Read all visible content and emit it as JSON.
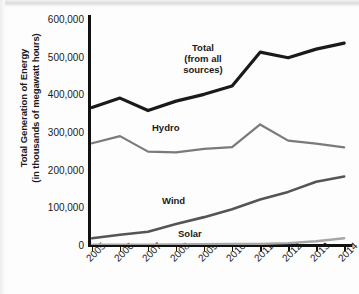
{
  "chart_data": {
    "type": "line",
    "title": "",
    "xlabel": "",
    "ylabel": "Total Generation of Energy (in thousands of megawatt hours)",
    "ylabel_line1": "Total Generation of Energy",
    "ylabel_line2": "(in thousands of megawatt hours)",
    "categories": [
      "2005",
      "2006",
      "2007",
      "2008",
      "2009",
      "2010",
      "2011",
      "2012",
      "2013",
      "2014"
    ],
    "x": [
      2005,
      2006,
      2007,
      2008,
      2009,
      2010,
      2011,
      2012,
      2013,
      2014
    ],
    "ylim": [
      0,
      600000
    ],
    "yticks": [
      0,
      100000,
      200000,
      300000,
      400000,
      500000,
      600000
    ],
    "ytick_labels": [
      "0",
      "100,000",
      "200,000",
      "300,000",
      "400,000",
      "500,000",
      "600,000"
    ],
    "grid": false,
    "legend_position": "inline-annotations",
    "series": [
      {
        "name": "Total (from all sources)",
        "label_line1": "Total",
        "label_line2": "(from all",
        "label_line3": "sources)",
        "color": "#1a1a1a",
        "width": 3.2,
        "values": [
          365000,
          390000,
          357000,
          382000,
          400000,
          422000,
          512000,
          497000,
          520000,
          536000
        ]
      },
      {
        "name": "Hydro",
        "label_line1": "Hydro",
        "color": "#7a7a7a",
        "width": 2.2,
        "values": [
          270000,
          289000,
          248000,
          246000,
          255000,
          260000,
          320000,
          277000,
          269000,
          259000
        ]
      },
      {
        "name": "Wind",
        "label_line1": "Wind",
        "color": "#555555",
        "width": 2.6,
        "values": [
          18000,
          27000,
          35000,
          56000,
          74000,
          95000,
          121000,
          141000,
          168000,
          182000
        ]
      },
      {
        "name": "Solar",
        "label_line1": "Solar",
        "color": "#a6a6a6",
        "width": 2.4,
        "values": [
          1000,
          1000,
          1000,
          1500,
          2000,
          2500,
          3000,
          5000,
          10000,
          18000
        ]
      }
    ]
  }
}
